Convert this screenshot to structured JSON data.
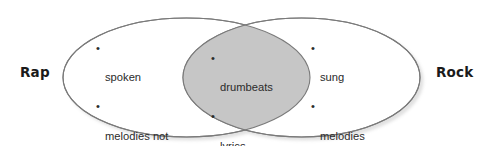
{
  "diagram": {
    "type": "venn",
    "title_visible": false,
    "background_color": "#ffffff",
    "outline_color": "#7a7a7a",
    "intersection_fill": "#c6c6c6",
    "set_fill": "#ffffff",
    "text_color": "#2b2b2b",
    "label_color": "#1a1a1a",
    "left_label": "Rap",
    "right_label": "Rock",
    "left_only_items": [
      "spoken",
      "melodies not important"
    ],
    "intersection_items": [
      "drumbeats",
      "lyrics",
      "rhymes"
    ],
    "right_only_items": [
      "sung",
      "melodies important"
    ],
    "bullet_glyph": "•"
  }
}
